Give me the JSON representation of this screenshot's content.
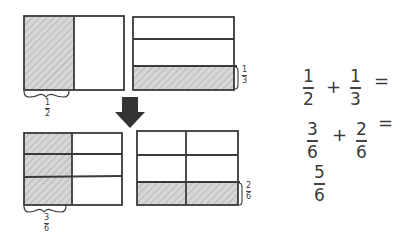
{
  "diagram": {
    "colors": {
      "stroke": "#3a3a3a",
      "shade": "#d0d0d0",
      "hatch": "#aaaaaa",
      "arrow": "#333333"
    },
    "top_left_box": {
      "columns": 2,
      "rows": 1,
      "shaded": "left column",
      "label": {
        "num": "1",
        "den": "2"
      }
    },
    "top_right_box": {
      "columns": 1,
      "rows": 3,
      "shaded": "bottom row",
      "label": {
        "num": "1",
        "den": "3"
      }
    },
    "arrow": {
      "direction": "down",
      "icon": "down-arrow-icon"
    },
    "bottom_left_box": {
      "columns": 2,
      "rows": 3,
      "shaded": "left column",
      "label": {
        "num": "3",
        "den": "6"
      }
    },
    "bottom_right_box": {
      "columns": 2,
      "rows": 3,
      "shaded": "bottom row",
      "label": {
        "num": "2",
        "den": "6"
      }
    }
  },
  "equations": {
    "line1": {
      "a": {
        "num": "1",
        "den": "2"
      },
      "op": "+",
      "b": {
        "num": "1",
        "den": "3"
      },
      "eq": "="
    },
    "line2": {
      "a": {
        "num": "3",
        "den": "6"
      },
      "op": "+",
      "b": {
        "num": "2",
        "den": "6"
      },
      "eq": "="
    },
    "line3": {
      "result": {
        "num": "5",
        "den": "6"
      }
    }
  }
}
